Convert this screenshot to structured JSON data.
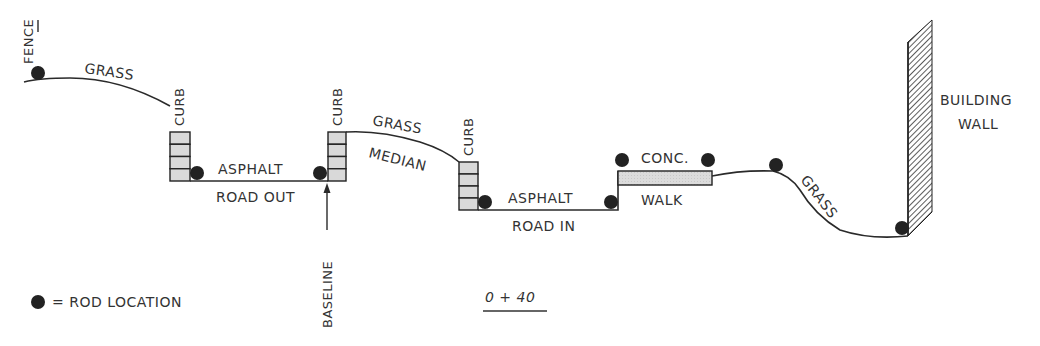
{
  "diagram": {
    "title": "0 + 40",
    "labels": {
      "fence": "FENCE",
      "grass_left": "GRASS",
      "curb_1": "CURB",
      "asphalt_out": "ASPHALT",
      "road_out": "ROAD OUT",
      "curb_2": "CURB",
      "baseline": "BASELINE",
      "grass_median": "GRASS",
      "median": "MEDIAN",
      "curb_3": "CURB",
      "asphalt_in": "ASPHALT",
      "road_in": "ROAD IN",
      "conc": "CONC.",
      "walk": "WALK",
      "grass_right": "GRASS",
      "building": "BUILDING",
      "wall": "WALL"
    },
    "legend": {
      "symbol": "rod-location-dot",
      "text": "= ROD LOCATION"
    },
    "rod_location_count": 10,
    "colors": {
      "line": "#2a2a2a",
      "curb_fill": "#d9d9d9",
      "dot": "#222222",
      "text": "#333333"
    }
  }
}
